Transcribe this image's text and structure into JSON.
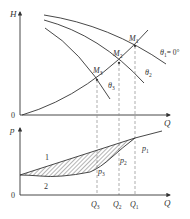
{
  "figure": {
    "type": "pump characteristic curves with throttling valve angles",
    "upper_plot": {
      "y_axis_label": "H",
      "x_axis_label": "Q",
      "origin_label": "0",
      "curves": [
        {
          "name": "theta1",
          "label": "θ₁ = 0°",
          "label_main": "θ",
          "label_sub": "1",
          "label_suffix": "= 0°"
        },
        {
          "name": "theta2",
          "label": "θ₂",
          "label_main": "θ",
          "label_sub": "2"
        },
        {
          "name": "theta3",
          "label": "θ₃",
          "label_main": "θ",
          "label_sub": "3"
        }
      ],
      "operating_points": [
        {
          "name": "M1",
          "label_main": "M",
          "label_sub": "1"
        },
        {
          "name": "M2",
          "label_main": "M",
          "label_sub": "2"
        },
        {
          "name": "M3",
          "label_main": "M",
          "label_sub": "3"
        }
      ]
    },
    "lower_plot": {
      "y_axis_label": "p",
      "x_axis_label": "Q",
      "origin_label": "0",
      "curve_labels": [
        "1",
        "2"
      ],
      "points": [
        {
          "name": "p1",
          "label_main": "p",
          "label_sub": "1"
        },
        {
          "name": "p2",
          "label_main": "p",
          "label_sub": "2"
        },
        {
          "name": "p3",
          "label_main": "p",
          "label_sub": "3"
        }
      ],
      "flow_ticks": [
        {
          "name": "Q3",
          "label_main": "Q",
          "label_sub": "3"
        },
        {
          "name": "Q2",
          "label_main": "Q",
          "label_sub": "2"
        },
        {
          "name": "Q1",
          "label_main": "Q",
          "label_sub": "1"
        }
      ]
    },
    "colors": {
      "line": "#333333",
      "dashed": "#8a8a8a",
      "hatch": "#444444"
    }
  }
}
